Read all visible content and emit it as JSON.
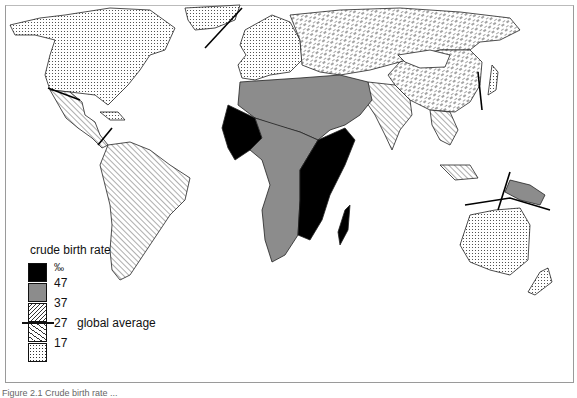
{
  "figure": {
    "type": "choropleth world map",
    "caption_partial": "Figure 2.1 Crude birth rate ..."
  },
  "legend": {
    "title": "crude birth rate",
    "unit": "‰",
    "classes": [
      {
        "range": "> 47",
        "fill": "#000000",
        "pattern": "solid-black"
      },
      {
        "range": "37–47",
        "fill": "#8c8c8c",
        "pattern": "solid-grey"
      },
      {
        "range": "27–37",
        "fill": "#ffffff",
        "pattern": "diagonal-hatch"
      },
      {
        "range": "17–27",
        "fill": "#ffffff",
        "pattern": "dashed-hatch"
      },
      {
        "range": "< 17",
        "fill": "#ffffff",
        "pattern": "dots"
      }
    ],
    "tick_labels": [
      "‰",
      "47",
      "37",
      "27",
      "17"
    ],
    "global_average_value": "27",
    "global_average_label": "global average"
  },
  "regions": [
    {
      "name": "North America",
      "class": "< 17"
    },
    {
      "name": "Greenland",
      "class": "< 17"
    },
    {
      "name": "Central America & Mexico",
      "class": "27–37"
    },
    {
      "name": "Caribbean",
      "class": "< 17"
    },
    {
      "name": "South America",
      "class": "27–37"
    },
    {
      "name": "Western Europe",
      "class": "< 17"
    },
    {
      "name": "USSR",
      "class": "17–27"
    },
    {
      "name": "China",
      "class": "17–27"
    },
    {
      "name": "Japan & Korea",
      "class": "< 17"
    },
    {
      "name": "South Asia",
      "class": "27–37"
    },
    {
      "name": "Southeast Asia",
      "class": "27–37"
    },
    {
      "name": "North Africa & Middle East",
      "class": "37–47"
    },
    {
      "name": "West Africa",
      "class": "> 47"
    },
    {
      "name": "East Africa",
      "class": "> 47"
    },
    {
      "name": "Madagascar",
      "class": "> 47"
    },
    {
      "name": "Central & Southern Africa",
      "class": "37–47"
    },
    {
      "name": "New Guinea",
      "class": "37–47"
    },
    {
      "name": "Australia & New Zealand",
      "class": "< 17"
    }
  ]
}
